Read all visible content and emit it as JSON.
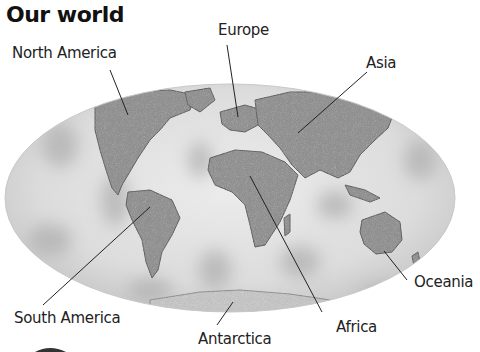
{
  "title": "Our world",
  "labels": {
    "north_america": "North America",
    "europe": "Europe",
    "asia": "Asia",
    "south_america": "South America",
    "africa": "Africa",
    "antarctica": "Antarctica",
    "oceania": "Oceania"
  },
  "colors": {
    "ocean_light": "#e6e6e6",
    "ocean_dark": "#b8b8b8",
    "land": "#8a8a8a",
    "leader": "#222222",
    "text": "#1a1a1a"
  }
}
